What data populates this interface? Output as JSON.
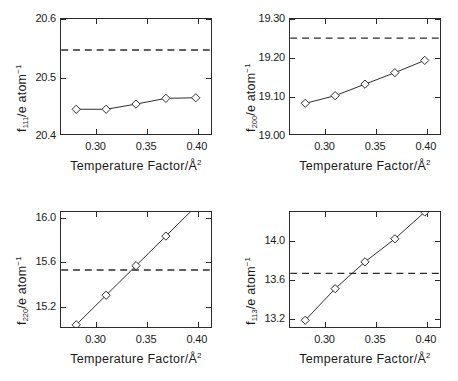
{
  "figure": {
    "panel_count": 4,
    "shared_xlabel_prefix": "Temperature Factor/Å",
    "shared_xlabel_sup": "2",
    "ylabel_suffix": "/e atom",
    "ylabel_sup": "−1"
  },
  "chart_data": [
    {
      "type": "line",
      "title": "",
      "panel_index": 0,
      "ylabel_symbol": "f",
      "ylabel_subscript": "111",
      "ylabel": "f_111/e atom^-1",
      "xlabel": "Temperature Factor/Å²",
      "xlim": [
        0.265,
        0.415
      ],
      "ylim": [
        20.4,
        20.6
      ],
      "xticks": [
        0.3,
        0.35,
        0.4
      ],
      "xticklabels": [
        "0.30",
        "0.35",
        "0.40"
      ],
      "yticks": [
        20.4,
        20.5,
        20.6
      ],
      "yticklabels": [
        "20.4",
        "20.5",
        "20.6"
      ],
      "grid": false,
      "legend": "none",
      "series": [
        {
          "name": "calculated",
          "marker": "diamond",
          "x": [
            0.28,
            0.31,
            0.34,
            0.37,
            0.4
          ],
          "values": [
            20.443,
            20.443,
            20.452,
            20.462,
            20.463
          ]
        }
      ],
      "reference_line": {
        "style": "dashed",
        "value": 20.546,
        "label": ""
      }
    },
    {
      "type": "line",
      "title": "",
      "panel_index": 1,
      "ylabel_symbol": "f",
      "ylabel_subscript": "200",
      "ylabel": "f_200/e atom^-1",
      "xlabel": "Temperature Factor/Å²",
      "xlim": [
        0.265,
        0.415
      ],
      "ylim": [
        19.0,
        19.3
      ],
      "xticks": [
        0.3,
        0.35,
        0.4
      ],
      "xticklabels": [
        "0.30",
        "0.35",
        "0.40"
      ],
      "yticks": [
        19.0,
        19.1,
        19.2,
        19.3
      ],
      "yticklabels": [
        "19.00",
        "19.10",
        "19.20",
        "19.30"
      ],
      "grid": false,
      "legend": "none",
      "series": [
        {
          "name": "calculated",
          "marker": "diamond",
          "x": [
            0.28,
            0.31,
            0.34,
            0.37,
            0.4
          ],
          "values": [
            19.08,
            19.1,
            19.13,
            19.16,
            19.192
          ]
        }
      ],
      "reference_line": {
        "style": "dashed",
        "value": 19.25,
        "label": ""
      }
    },
    {
      "type": "line",
      "title": "",
      "panel_index": 2,
      "ylabel_symbol": "f",
      "ylabel_subscript": "220",
      "ylabel": "f_220/e atom^-1",
      "xlabel": "Temperature Factor/Å²",
      "xlim": [
        0.265,
        0.415
      ],
      "ylim": [
        15.0,
        16.05
      ],
      "xticks": [
        0.3,
        0.35,
        0.4
      ],
      "xticklabels": [
        "0.30",
        "0.35",
        "0.40"
      ],
      "yticks": [
        15.2,
        15.6,
        16.0
      ],
      "yticklabels": [
        "15.2",
        "15.6",
        "16.0"
      ],
      "grid": false,
      "legend": "none",
      "series": [
        {
          "name": "calculated",
          "marker": "diamond",
          "x": [
            0.28,
            0.31,
            0.34,
            0.37,
            0.4
          ],
          "values": [
            15.02,
            15.29,
            15.56,
            15.83,
            16.1
          ]
        }
      ],
      "reference_line": {
        "style": "dashed",
        "value": 15.52,
        "label": ""
      }
    },
    {
      "type": "line",
      "title": "",
      "panel_index": 3,
      "ylabel_symbol": "f",
      "ylabel_subscript": "113",
      "ylabel": "f_113/e atom^-1",
      "xlabel": "Temperature Factor/Å²",
      "xlim": [
        0.265,
        0.415
      ],
      "ylim": [
        13.1,
        14.3
      ],
      "xticks": [
        0.3,
        0.35,
        0.4
      ],
      "xticklabels": [
        "0.30",
        "0.35",
        "0.40"
      ],
      "yticks": [
        13.2,
        13.6,
        14.0
      ],
      "yticklabels": [
        "13.2",
        "13.6",
        "14.0"
      ],
      "grid": false,
      "legend": "none",
      "series": [
        {
          "name": "calculated",
          "marker": "diamond",
          "x": [
            0.28,
            0.31,
            0.34,
            0.37,
            0.4
          ],
          "values": [
            13.17,
            13.5,
            13.78,
            14.02,
            14.3
          ]
        }
      ],
      "reference_line": {
        "style": "dashed",
        "value": 13.66,
        "label": ""
      }
    }
  ]
}
